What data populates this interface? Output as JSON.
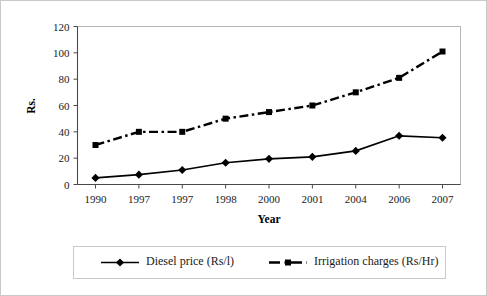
{
  "chart_data": {
    "type": "line",
    "title": "",
    "xlabel": "Year",
    "ylabel": "Rs.",
    "categories": [
      "1990",
      "1997",
      "1997",
      "1998",
      "2000",
      "2001",
      "2004",
      "2006",
      "2007"
    ],
    "ylim": [
      0,
      120
    ],
    "yticks": [
      0,
      20,
      40,
      60,
      80,
      100,
      120
    ],
    "grid": false,
    "legend_position": "bottom",
    "series": [
      {
        "name": "Diesel price (Rs/l)",
        "marker": "diamond",
        "linestyle": "solid",
        "color": "#000000",
        "values": [
          5,
          7.5,
          11,
          16.5,
          19.5,
          21,
          25.5,
          37,
          35.5
        ]
      },
      {
        "name": "Irrigation charges (Rs/Hr)",
        "marker": "square",
        "linestyle": "dashdot",
        "color": "#000000",
        "values": [
          30,
          40,
          40,
          50,
          55,
          60,
          70,
          81,
          101
        ]
      }
    ]
  },
  "axes": {
    "y_tick_labels": [
      "120",
      "100",
      "80",
      "60",
      "40",
      "20",
      "0"
    ],
    "x_tick_labels": [
      "1990",
      "1997",
      "1997",
      "1998",
      "2000",
      "2001",
      "2004",
      "2006",
      "2007"
    ],
    "y_axis_title": "Rs.",
    "x_axis_title": "Year"
  },
  "legend": {
    "items": [
      {
        "label": "Diesel price (Rs/l)",
        "marker": "diamond-marker",
        "line": "solid-line"
      },
      {
        "label": "Irrigation charges (Rs/Hr)",
        "marker": "square-marker",
        "line": "dashdot-line"
      }
    ]
  }
}
